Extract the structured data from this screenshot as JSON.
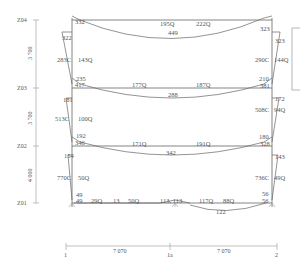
{
  "diagram": {
    "title": "",
    "levels": [
      {
        "name": "Z04",
        "y": 20
      },
      {
        "name": "Z03",
        "y": 88
      },
      {
        "name": "Z02",
        "y": 146
      },
      {
        "name": "Z01",
        "y": 203
      }
    ],
    "story_heights": [
      "3 700",
      "3 700",
      "4 000"
    ],
    "axes": [
      {
        "name": "1",
        "x": 68
      },
      {
        "name": "1a",
        "x": 175
      },
      {
        "name": "2",
        "x": 277
      }
    ],
    "spans": [
      "7 070",
      "7 070"
    ],
    "beams": [
      {
        "level": "Z04",
        "left_end_moment": "332",
        "right_end_moment": "323",
        "mid_moment": "449",
        "shear_left": "195Q",
        "shear_right": "222Q"
      },
      {
        "level": "Z03",
        "left_end_moment_above": "235",
        "left_end_moment": "417",
        "right_end_moment_above": "210",
        "right_end_moment": "381",
        "mid_moment": "288",
        "shear_left": "177Q",
        "shear_right": "187Q"
      },
      {
        "level": "Z02",
        "left_end_moment_above": "192",
        "left_end_moment": "346",
        "right_end_moment_above": "180",
        "right_end_moment": "328",
        "mid_moment": "342",
        "shear_left": "171Q",
        "shear_right": "191Q"
      },
      {
        "level": "Z01",
        "left_end_moment_above": "49",
        "left_end_moment": "49",
        "right_end_moment_above": "56",
        "right_end_moment": "56",
        "shear_1": "29Q",
        "moment_1": "13",
        "shear_2": "50Q",
        "support_moments": "113, 113",
        "shear_3": "117Q",
        "shear_4": "88Q",
        "span_moment": "122"
      }
    ],
    "columns": {
      "left": [
        {
          "story": "Z03-Z04",
          "top_moment": "322",
          "axial": "283C",
          "shear": "143Q"
        },
        {
          "story": "Z02-Z03",
          "top_moment": "181",
          "axial": "513C",
          "shear": "100Q"
        },
        {
          "story": "Z01-Z02",
          "top_moment": "154",
          "axial": "770C",
          "shear": "50Q"
        }
      ],
      "right": [
        {
          "story": "Z03-Z04",
          "top_moment": "323",
          "axial": "290C",
          "shear": "144Q"
        },
        {
          "story": "Z02-Z03",
          "top_moment": "172",
          "axial": "508C",
          "shear": "94Q"
        },
        {
          "story": "Z01-Z02",
          "top_moment": "143",
          "axial": "736C",
          "shear": "49Q"
        }
      ]
    }
  }
}
